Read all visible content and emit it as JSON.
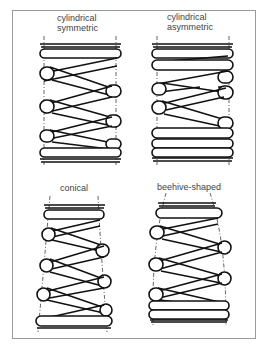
{
  "figure": {
    "panels": [
      {
        "id": "cylindrical-symmetric",
        "label_line1": "cylindrical",
        "label_line2": "symmetric"
      },
      {
        "id": "cylindrical-asymmetric",
        "label_line1": "cylindrical",
        "label_line2": "asymmetric"
      },
      {
        "id": "conical",
        "label_line1": "conical",
        "label_line2": ""
      },
      {
        "id": "beehive-shaped",
        "label_line1": "beehive-shaped",
        "label_line2": ""
      }
    ],
    "colors": {
      "ink": "#111111",
      "frame": "#9a9a9a",
      "label": "#444444",
      "background": "#ffffff"
    }
  }
}
